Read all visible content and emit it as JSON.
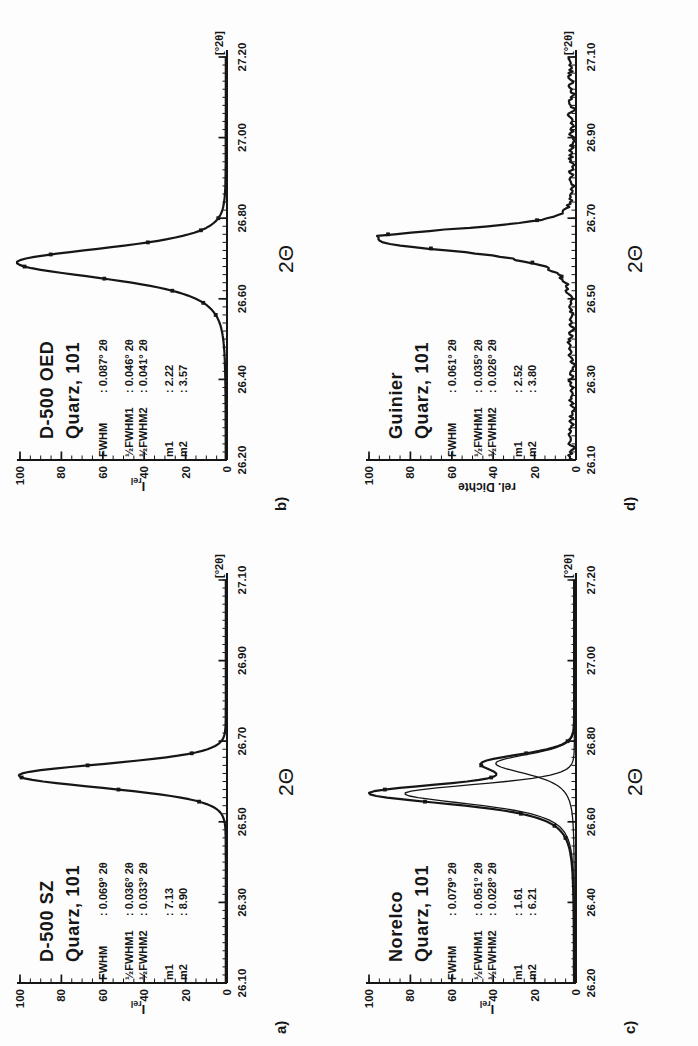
{
  "figure": {
    "background": "#fdfdfd",
    "ink": "#161616"
  },
  "panels": [
    {
      "label": "a)",
      "title1": "D-500 SZ",
      "title2": "Quarz, 101",
      "ylabel_main": "I",
      "ylabel_sub": "rel",
      "stats": [
        {
          "label": "FWHM",
          "value": ": 0.069° 2θ"
        },
        {
          "label": "½FWHM1",
          "value": ": 0.036° 2θ"
        },
        {
          "label": "½FWHM2",
          "value": ": 0.033° 2θ"
        },
        {
          "label": "m1",
          "value": ": 7.13"
        },
        {
          "label": "m2",
          "value": ": 8.90"
        }
      ]
    },
    {
      "label": "b)",
      "title1": "D-500 OED",
      "title2": "Quarz, 101",
      "ylabel_main": "I",
      "ylabel_sub": "rel",
      "stats": [
        {
          "label": "FWHM",
          "value": ": 0.087° 2θ"
        },
        {
          "label": "½FWHM1",
          "value": ": 0.046° 2θ"
        },
        {
          "label": "½FWHM2",
          "value": ": 0.041° 2θ"
        },
        {
          "label": "m1",
          "value": ": 2.22"
        },
        {
          "label": "m2",
          "value": ": 3.57"
        }
      ]
    },
    {
      "label": "c)",
      "title1": "Norelco",
      "title2": "Quarz, 101",
      "ylabel_main": "I",
      "ylabel_sub": "rel",
      "stats": [
        {
          "label": "FWHM",
          "value": ": 0.079° 2θ"
        },
        {
          "label": "½FWHM1",
          "value": ": 0.051° 2θ"
        },
        {
          "label": "½FWHM2",
          "value": ": 0.028° 2θ"
        },
        {
          "label": "m1",
          "value": ": 1.61"
        },
        {
          "label": "m2",
          "value": ": 6.21"
        }
      ]
    },
    {
      "label": "d)",
      "title1": "Guinier",
      "title2": "Quarz, 101",
      "ylabel_main": "rel. Dichte",
      "ylabel_sub": "",
      "stats": [
        {
          "label": "FWHM",
          "value": ": 0.061° 2θ"
        },
        {
          "label": "½FWHM1",
          "value": ": 0.035° 2θ"
        },
        {
          "label": "½FWHM2",
          "value": ": 0.026° 2θ"
        },
        {
          "label": "m1",
          "value": ": 2.52"
        },
        {
          "label": "m2",
          "value": ": 3.80"
        }
      ]
    }
  ],
  "chart_data": [
    {
      "type": "line",
      "panel": "a)",
      "title": "D-500 SZ, Quarz, 101",
      "xlabel": "2Θ",
      "unit": "[°2θ]",
      "ylabel": "Irel",
      "xmin": 26.1,
      "xmax": 27.1,
      "xticks": [
        "26.10",
        "26.30",
        "26.50",
        "26.70",
        "26.90",
        "27.10"
      ],
      "yticks": [
        0,
        20,
        40,
        60,
        80,
        100
      ],
      "ylim": [
        0,
        100
      ],
      "grid": false,
      "peak": {
        "center": 26.615,
        "amplitude": 100,
        "hwhm_left": 0.036,
        "hwhm_right": 0.033,
        "m_left": 7.13,
        "m_right": 8.9
      },
      "baseline": 0.6,
      "noise": 0,
      "dot_step": 0.03
    },
    {
      "type": "line",
      "panel": "b)",
      "title": "D-500 OED, Quarz, 101",
      "xlabel": "2Θ",
      "unit": "[°2θ]",
      "ylabel": "Irel",
      "xmin": 26.2,
      "xmax": 27.2,
      "xticks": [
        "26.20",
        "26.40",
        "26.60",
        "26.80",
        "27.00",
        "27.20"
      ],
      "yticks": [
        0,
        20,
        40,
        60,
        80,
        100
      ],
      "ylim": [
        0,
        100
      ],
      "grid": false,
      "peak": {
        "center": 26.69,
        "amplitude": 101,
        "hwhm_left": 0.046,
        "hwhm_right": 0.041,
        "m_left": 2.22,
        "m_right": 3.57
      },
      "baseline": 0.6,
      "noise": 0,
      "dot_step": 0.03
    },
    {
      "type": "line",
      "panel": "c)",
      "title": "Norelco, Quarz, 101",
      "xlabel": "2Θ",
      "unit": "[°2θ]",
      "ylabel": "Irel",
      "xmin": 26.2,
      "xmax": 27.2,
      "xticks": [
        "26.20",
        "26.40",
        "26.60",
        "26.80",
        "27.00",
        "27.20"
      ],
      "yticks": [
        0,
        20,
        40,
        60,
        80,
        100
      ],
      "ylim": [
        0,
        100
      ],
      "grid": false,
      "components": [
        {
          "center": 26.67,
          "amplitude": 82,
          "hwhm_left": 0.032,
          "hwhm_right": 0.026,
          "m_left": 1.61,
          "m_right": 6.21
        },
        {
          "center": 26.745,
          "amplitude": 38,
          "hwhm_left": 0.032,
          "hwhm_right": 0.026,
          "m_left": 1.61,
          "m_right": 6.21
        }
      ],
      "normalize_to": 100,
      "baseline": 0.8,
      "noise": 0,
      "dot_step": 0.03
    },
    {
      "type": "line",
      "panel": "d)",
      "title": "Guinier, Quarz, 101",
      "xlabel": "2Θ",
      "unit": "[°2θ]",
      "ylabel": "rel. Dichte",
      "xmin": 26.1,
      "xmax": 27.1,
      "xticks": [
        "26.10",
        "26.30",
        "26.50",
        "26.70",
        "26.90",
        "27.10"
      ],
      "yticks": [
        0,
        20,
        40,
        60,
        80,
        100
      ],
      "ylim": [
        0,
        100
      ],
      "grid": false,
      "peak": {
        "center": 26.65,
        "amplitude": 99,
        "hwhm_left": 0.035,
        "hwhm_right": 0.026,
        "m_left": 2.52,
        "m_right": 3.8
      },
      "baseline": 2.2,
      "noise": 1.3,
      "dot_step": 0.035
    }
  ]
}
